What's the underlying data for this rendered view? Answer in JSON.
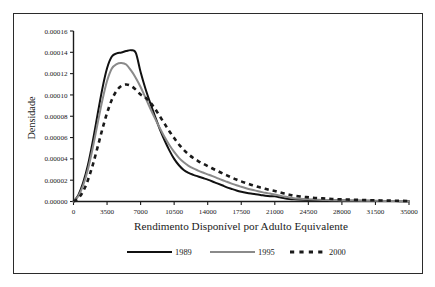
{
  "figure": {
    "border_color": "#2b2b2b",
    "background": "#ffffff"
  },
  "chart_data": {
    "type": "line",
    "title": "",
    "xlabel": "Rendimento Disponível por Adulto Equivalente",
    "ylabel": "Densidade",
    "xlim": [
      0,
      35000
    ],
    "ylim": [
      0,
      0.00016
    ],
    "grid": false,
    "legend_position": "bottom",
    "xticks": [
      0,
      3500,
      7000,
      10500,
      14000,
      17500,
      21000,
      24500,
      28000,
      31500,
      35000
    ],
    "xtick_labels": [
      "0",
      "3500",
      "7000",
      "10500",
      "14000",
      "17500",
      "21000",
      "24500",
      "28000",
      "31500",
      "35000"
    ],
    "yticks": [
      0.0,
      2e-05,
      4e-05,
      6e-05,
      8e-05,
      0.0001,
      0.00012,
      0.00014,
      0.00016
    ],
    "ytick_labels": [
      "0.00000",
      "0.00002",
      "0.00004",
      "0.00006",
      "0.00008",
      "0.00010",
      "0.00012",
      "0.00014",
      "0.00016"
    ],
    "x": [
      0,
      500,
      1000,
      1500,
      2000,
      2500,
      3000,
      3500,
      4000,
      4500,
      5000,
      5500,
      6000,
      6500,
      7000,
      7500,
      8000,
      8500,
      9000,
      9500,
      10000,
      10500,
      11000,
      11500,
      12000,
      12500,
      13000,
      13500,
      14000,
      14500,
      15000,
      15500,
      16000,
      16500,
      17000,
      17500,
      18000,
      18500,
      19000,
      19500,
      20000,
      20500,
      21000,
      21500,
      22000,
      22500,
      23000,
      24000,
      25000,
      26000,
      27000,
      28000,
      29000,
      30000,
      31000,
      32000,
      33000,
      34000,
      35000
    ],
    "series": [
      {
        "name": "1989",
        "color": "#111111",
        "style": "solid",
        "peak_x": 5200,
        "peak_y": 0.000142,
        "values": [
          0.0,
          6e-06,
          1.75e-05,
          3.4e-05,
          5.6e-05,
          8.1e-05,
          0.0001055,
          0.000125,
          0.000136,
          0.000139,
          0.0001398,
          0.0001412,
          0.000142,
          0.0001395,
          0.0001215,
          0.000106,
          9.25e-05,
          8e-05,
          6.8e-05,
          5.75e-05,
          4.8e-05,
          4e-05,
          3.4e-05,
          2.95e-05,
          2.68e-05,
          2.5e-05,
          2.35e-05,
          2.2e-05,
          2.05e-05,
          1.88e-05,
          1.7e-05,
          1.52e-05,
          1.33e-05,
          1.18e-05,
          1.04e-05,
          9.2e-06,
          8.2e-06,
          7.4e-06,
          6.8e-06,
          6.2e-06,
          5.5e-06,
          5e-06,
          4.8e-06,
          4e-06,
          3.1e-06,
          2.4e-06,
          2e-06,
          1.6e-06,
          1.3e-06,
          1.1e-06,
          1e-06,
          9e-07,
          8e-07,
          7e-07,
          6e-07,
          5e-07,
          4e-07,
          3e-07,
          2e-07
        ]
      },
      {
        "name": "1995",
        "color": "#8a8a8a",
        "style": "solid",
        "peak_x": 5300,
        "peak_y": 0.00013,
        "values": [
          0.0,
          5e-06,
          1.5e-05,
          3e-05,
          5e-05,
          7.25e-05,
          9.45e-05,
          0.000113,
          0.0001248,
          0.000129,
          0.00013,
          0.0001285,
          0.000123,
          0.000116,
          0.0001075,
          9.75e-05,
          8.75e-05,
          7.8e-05,
          6.9e-05,
          6.05e-05,
          5.3e-05,
          4.65e-05,
          4.1e-05,
          3.68e-05,
          3.35e-05,
          3.1e-05,
          2.9e-05,
          2.72e-05,
          2.55e-05,
          2.38e-05,
          2.2e-05,
          2.02e-05,
          1.85e-05,
          1.68e-05,
          1.52e-05,
          1.38e-05,
          1.25e-05,
          1.13e-05,
          1.02e-05,
          9.2e-06,
          8.2e-06,
          7.4e-06,
          6.6e-06,
          5.6e-06,
          4.6e-06,
          3.8e-06,
          3.1e-06,
          2.4e-06,
          1.9e-06,
          1.5e-06,
          1.2e-06,
          1e-06,
          9e-07,
          8e-07,
          7e-07,
          6e-07,
          5e-07,
          4e-07,
          3e-07
        ]
      },
      {
        "name": "2000",
        "color": "#1a1a1a",
        "style": "dashed",
        "peak_x": 5700,
        "peak_y": 0.00011,
        "values": [
          0.0,
          3e-06,
          9.5e-06,
          2e-05,
          3.4e-05,
          5.05e-05,
          6.75e-05,
          8.3e-05,
          9.55e-05,
          0.000104,
          0.0001085,
          0.0001098,
          0.0001085,
          0.000105,
          0.0001005,
          9.75e-05,
          9.3e-05,
          8.7e-05,
          8e-05,
          7.3e-05,
          6.6e-05,
          5.95e-05,
          5.35e-05,
          4.85e-05,
          4.42e-05,
          4.08e-05,
          3.8e-05,
          3.55e-05,
          3.32e-05,
          3.1e-05,
          2.88e-05,
          2.66e-05,
          2.45e-05,
          2.25e-05,
          2.06e-05,
          1.89e-05,
          1.73e-05,
          1.58e-05,
          1.44e-05,
          1.31e-05,
          1.19e-05,
          1.08e-05,
          9.8e-06,
          8.6e-06,
          7.4e-06,
          6.4e-06,
          5.5e-06,
          4.4e-06,
          3.5e-06,
          2.9e-06,
          2.4e-06,
          2e-06,
          1.7e-06,
          1.4e-06,
          1.2e-06,
          1e-06,
          8e-07,
          7e-07,
          5e-07
        ]
      }
    ],
    "legend": [
      "1989",
      "1995",
      "2000"
    ]
  }
}
